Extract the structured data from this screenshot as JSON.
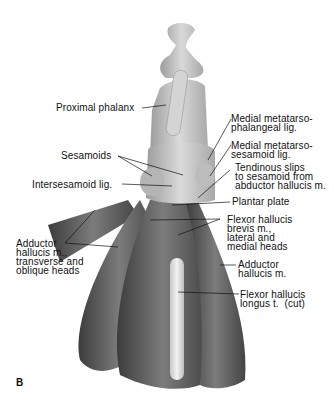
{
  "figure": {
    "letter": "B",
    "colors": {
      "background": "#ffffff",
      "bone": "#c8c8c8",
      "muscle_dark": "#4a4a4a",
      "muscle_mid": "#7a7a7a",
      "tendon": "#e2e2e2",
      "text": "#111111"
    }
  },
  "labels": [
    {
      "id": "proximal-phalanx",
      "text": "Proximal phalanx"
    },
    {
      "id": "medial-mtp-lig",
      "text": "Medial metatarso-\nphalangeal lig."
    },
    {
      "id": "medial-ms-lig",
      "text": "Medial metatarso-\nsesamoid lig."
    },
    {
      "id": "sesamoids",
      "text": "Sesamoids"
    },
    {
      "id": "tendinous-slips",
      "text": "Tendinous slips\nto sesamoid from\nabductor hallucis m."
    },
    {
      "id": "intersesamoid-lig",
      "text": "Intersesamoid lig."
    },
    {
      "id": "plantar-plate",
      "text": "Plantar plate"
    },
    {
      "id": "fhb",
      "text": "Flexor hallucis\nbrevis m.,\nlateral and\nmedial heads"
    },
    {
      "id": "adductor-heads",
      "text": "Adductor\nhallucis m.,\ntransverse and\noblique heads"
    },
    {
      "id": "adductor-m",
      "text": "Adductor\nhallucis m."
    },
    {
      "id": "fhl",
      "text": "Flexor hallucis\nlongus t.  (cut)"
    }
  ]
}
